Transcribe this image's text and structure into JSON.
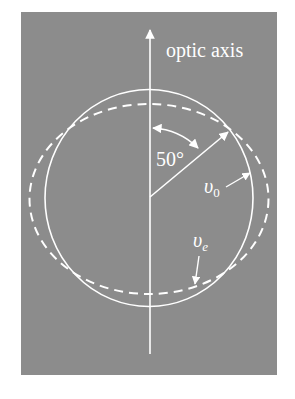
{
  "figure": {
    "background_color": "#ffffff",
    "panel_color": "#8c8c8c",
    "line_color": "#ffffff",
    "labels": {
      "axis": "optic axis",
      "angle": "50°",
      "ordinary_symbol": "υ",
      "ordinary_subscript": "0",
      "extraordinary_symbol": "υ",
      "extraordinary_subscript": "e"
    },
    "geometry": {
      "center": [
        149,
        198
      ],
      "ordinary_circle_radius": 104,
      "extraordinary_ellipse_rx": 119,
      "extraordinary_ellipse_ry": 95,
      "angle_from_axis_deg": 50
    }
  }
}
